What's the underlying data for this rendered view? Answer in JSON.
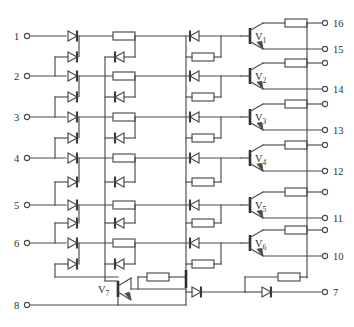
{
  "figure": {
    "kind": "schematic-circuit-diagram"
  },
  "pins": {
    "left": [
      {
        "id": "p1",
        "label": "1",
        "y": 36
      },
      {
        "id": "p2",
        "label": "2",
        "y": 76
      },
      {
        "id": "p3",
        "label": "3",
        "y": 117
      },
      {
        "id": "p4",
        "label": "4",
        "y": 158
      },
      {
        "id": "p5",
        "label": "5",
        "y": 205
      },
      {
        "id": "p6",
        "label": "6",
        "y": 243
      },
      {
        "id": "p8",
        "label": "8",
        "y": 305
      }
    ],
    "right": [
      {
        "id": "r16",
        "label": "16",
        "y": 22
      },
      {
        "id": "r15",
        "label": "15",
        "y": 48
      },
      {
        "id": "rb1",
        "label": "",
        "y": 67
      },
      {
        "id": "r14",
        "label": "14",
        "y": 89
      },
      {
        "id": "rb2",
        "label": "",
        "y": 107
      },
      {
        "id": "r13",
        "label": "13",
        "y": 128
      },
      {
        "id": "rb3",
        "label": "",
        "y": 146
      },
      {
        "id": "r12",
        "label": "12",
        "y": 170
      },
      {
        "id": "rb4",
        "label": "",
        "y": 188
      },
      {
        "id": "r11",
        "label": "11",
        "y": 212
      },
      {
        "id": "rb5",
        "label": "",
        "y": 230
      },
      {
        "id": "r10",
        "label": "10",
        "y": 255
      },
      {
        "id": "r7",
        "label": "7",
        "y": 292
      }
    ]
  },
  "transistors": [
    {
      "id": "V1",
      "label": "V",
      "sub": "1",
      "y": 33
    },
    {
      "id": "V2",
      "label": "V",
      "sub": "2",
      "y": 79
    },
    {
      "id": "V3",
      "label": "V",
      "sub": "3",
      "y": 120
    },
    {
      "id": "V4",
      "label": "V",
      "sub": "4",
      "y": 161
    },
    {
      "id": "V5",
      "label": "V",
      "sub": "5",
      "y": 208
    },
    {
      "id": "V6",
      "label": "V",
      "sub": "6",
      "y": 246
    },
    {
      "id": "V7",
      "label": "V",
      "sub": "7",
      "y": 289
    }
  ],
  "components": {
    "diode_symbol": "diode",
    "resistor_symbol": "resistor",
    "transistor_symbol": "npn-transistor",
    "terminal_symbol": "open-circle-terminal"
  },
  "colors": {
    "wire": "#4a4a4a",
    "text": "#2e2e2e",
    "background": "#ffffff"
  }
}
